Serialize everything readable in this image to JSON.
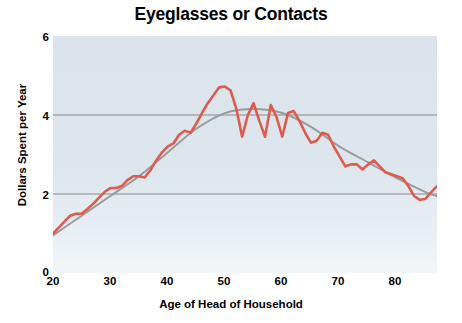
{
  "chart_data": {
    "type": "line",
    "title": "Eyeglasses or Contacts",
    "xlabel": "Age of Head of Household",
    "ylabel": "Dollars Spent per Year",
    "xlim": [
      20,
      87
    ],
    "ylim": [
      0,
      6
    ],
    "xticks": [
      20,
      30,
      40,
      50,
      60,
      70,
      80
    ],
    "yticks": [
      0,
      2,
      4,
      6
    ],
    "xtick_labels": [
      "20",
      "30",
      "40",
      "50",
      "60",
      "70",
      "80"
    ],
    "ytick_labels": [
      "0",
      "2",
      "4",
      "6"
    ],
    "grid": "horizontal gridlines at y=2 and y=4",
    "legend": "none",
    "series": [
      {
        "name": "observed",
        "color": "#de5a4e",
        "style": "jagged line",
        "x": [
          20,
          21,
          22,
          23,
          24,
          25,
          26,
          27,
          28,
          29,
          30,
          31,
          32,
          33,
          34,
          35,
          36,
          37,
          38,
          39,
          40,
          41,
          42,
          43,
          44,
          45,
          46,
          47,
          48,
          49,
          50,
          51,
          52,
          53,
          54,
          55,
          56,
          57,
          58,
          59,
          60,
          61,
          62,
          63,
          64,
          65,
          66,
          67,
          68,
          69,
          70,
          71,
          72,
          73,
          74,
          75,
          76,
          77,
          78,
          79,
          80,
          81,
          82,
          83,
          84,
          85,
          86,
          87
        ],
        "y": [
          1.0,
          1.15,
          1.3,
          1.45,
          1.5,
          1.5,
          1.62,
          1.75,
          1.9,
          2.05,
          2.15,
          2.15,
          2.2,
          2.35,
          2.45,
          2.45,
          2.42,
          2.6,
          2.85,
          3.05,
          3.2,
          3.28,
          3.5,
          3.6,
          3.55,
          3.78,
          4.05,
          4.3,
          4.5,
          4.7,
          4.72,
          4.62,
          4.15,
          3.45,
          4.0,
          4.3,
          3.85,
          3.45,
          4.25,
          3.95,
          3.45,
          4.05,
          4.1,
          3.85,
          3.55,
          3.3,
          3.35,
          3.55,
          3.5,
          3.2,
          2.95,
          2.7,
          2.75,
          2.75,
          2.62,
          2.75,
          2.85,
          2.7,
          2.55,
          2.5,
          2.45,
          2.4,
          2.2,
          1.95,
          1.85,
          1.88,
          2.05,
          2.2
        ]
      },
      {
        "name": "smoothed trend",
        "color": "#9a9a9a",
        "style": "smooth line",
        "x": [
          20,
          25,
          30,
          35,
          40,
          45,
          50,
          55,
          60,
          65,
          70,
          75,
          80,
          85,
          87
        ],
        "y": [
          0.95,
          1.45,
          1.95,
          2.45,
          3.05,
          3.65,
          4.05,
          4.15,
          4.05,
          3.7,
          3.2,
          2.8,
          2.4,
          2.05,
          1.95
        ]
      }
    ]
  }
}
